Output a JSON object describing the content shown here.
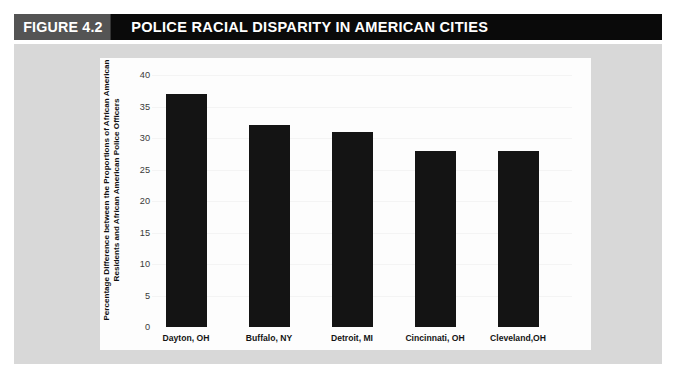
{
  "header": {
    "figure_number": "FIGURE 4.2",
    "title": "POLICE RACIAL DISPARITY IN AMERICAN CITIES",
    "number_box_color": "#545454",
    "bar_color": "#0a0a0a",
    "text_color": "#ffffff"
  },
  "chart_data": {
    "type": "bar",
    "title": "POLICE RACIAL DISPARITY IN AMERICAN CITIES",
    "categories": [
      "Dayton, OH",
      "Buffalo, NY",
      "Detroit, MI",
      "Cincinnati, OH",
      "Cleveland,OH"
    ],
    "values": [
      37,
      32,
      31,
      28,
      28
    ],
    "xlabel": "",
    "ylabel": "Percentage Difference between the Proportions of African American Residents and African American Police Officers",
    "ylim": [
      0,
      40
    ],
    "yticks": [
      0,
      5,
      10,
      15,
      20,
      25,
      30,
      35,
      40
    ],
    "ytick_labels": [
      "0",
      "5",
      "10",
      "15",
      "20",
      "25",
      "30",
      "35",
      "40"
    ],
    "grid": false,
    "legend": false,
    "bar_color": "#141414",
    "panel_color": "#fdfdfd",
    "frame_color": "#d8d8d8"
  }
}
